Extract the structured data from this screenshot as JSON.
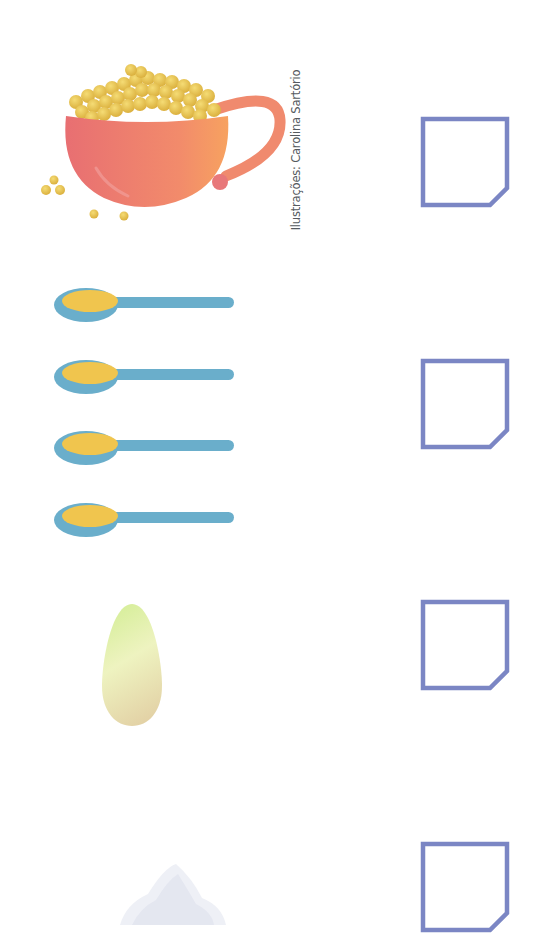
{
  "page": {
    "background": "#ffffff",
    "credit": "Ilustrações: Carolina Sartório"
  },
  "items": [
    {
      "name": "cup of corn/grains",
      "icon": "cup-of-grains-icon",
      "count": 1,
      "answer_box": ""
    },
    {
      "name": "spoons of oil",
      "icon": "spoon-icon",
      "count": 4,
      "answer_box": ""
    },
    {
      "name": "egg",
      "icon": "egg-icon",
      "count": 1,
      "answer_box": ""
    },
    {
      "name": "salt/sugar pile",
      "icon": "salt-pile-icon",
      "count": 1,
      "answer_box": ""
    }
  ],
  "colors": {
    "box_border": "#7b86c4",
    "cup": "#ee8a6c",
    "grains": "#e8c24a",
    "spoon": "#6aaecb",
    "spoon_fill": "#f0c54e",
    "egg_top": "#dcefa8",
    "egg_bottom": "#e9dcb4"
  }
}
